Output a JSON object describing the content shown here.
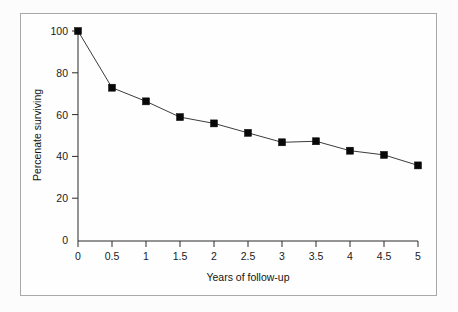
{
  "chart_data": {
    "type": "line",
    "title": "",
    "subtitle": "",
    "xlabel": "Years of follow-up",
    "ylabel": "Percenate surviving",
    "x": [
      0,
      0.5,
      1,
      1.5,
      2,
      2.5,
      3,
      3.5,
      4,
      4.5,
      5
    ],
    "values": [
      100,
      73,
      66.5,
      59,
      56,
      51.5,
      47,
      47.5,
      43,
      41,
      36
    ],
    "series": [
      {
        "name": "survival",
        "values": [
          100,
          73,
          66.5,
          59,
          56,
          51.5,
          47,
          47.5,
          43,
          41,
          36
        ]
      }
    ],
    "xtick_labels": [
      "0",
      "0.5",
      "1",
      "1.5",
      "2",
      "2.5",
      "3",
      "3.5",
      "4",
      "4.5",
      "5"
    ],
    "ytick_labels": [
      "0",
      "20",
      "40",
      "60",
      "80",
      "100"
    ],
    "yticks": [
      0,
      20,
      40,
      60,
      80,
      100
    ],
    "xlim": [
      0,
      5
    ],
    "ylim": [
      0,
      100
    ],
    "grid": false,
    "legend": "none",
    "marker": "square",
    "line_color": "#3c3c3c",
    "marker_color": "#080808",
    "axis_color": "#2a2a2a",
    "frame_color": "#a8a8a8",
    "background_color": "#fefefe"
  }
}
